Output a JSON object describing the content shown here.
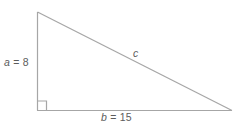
{
  "figure": {
    "name": "right-triangle-diagram",
    "background_color": "#ffffff",
    "stroke_color": "#a6a6a6",
    "text_color": "#5c5c5c",
    "labels": {
      "leg_a": {
        "variable": "a",
        "equals": " = ",
        "value": "8",
        "full": "a = 8"
      },
      "leg_b": {
        "variable": "b",
        "equals": " = ",
        "value": "15",
        "full": "b = 15"
      },
      "hypotenuse": {
        "variable": "c",
        "full": "c"
      }
    },
    "right_angle_marker": "right-angle-square",
    "geometry": {
      "apex": [
        37,
        12
      ],
      "right_angle_vertex": [
        37,
        110
      ],
      "base_right_vertex": [
        232,
        110
      ],
      "right_angle_marker_size": 9
    }
  }
}
